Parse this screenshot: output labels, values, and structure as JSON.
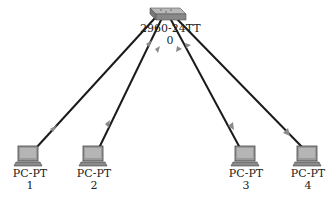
{
  "diagram": {
    "colors": {
      "link": "#1a1a1a",
      "arrow": "#8a8a8a",
      "device_fill": "#9a9a9a",
      "background": "#ffffff"
    },
    "switch": {
      "model": "2960-24TT",
      "id": "0",
      "icon": "switch-icon"
    },
    "pcs": [
      {
        "model": "PC-PT",
        "id": "1",
        "icon": "pc-icon"
      },
      {
        "model": "PC-PT",
        "id": "2",
        "icon": "pc-icon"
      },
      {
        "model": "PC-PT",
        "id": "3",
        "icon": "pc-icon"
      },
      {
        "model": "PC-PT",
        "id": "4",
        "icon": "pc-icon"
      }
    ],
    "links": [
      {
        "from": "0",
        "to": "1"
      },
      {
        "from": "0",
        "to": "2"
      },
      {
        "from": "0",
        "to": "3"
      },
      {
        "from": "0",
        "to": "4"
      }
    ]
  }
}
